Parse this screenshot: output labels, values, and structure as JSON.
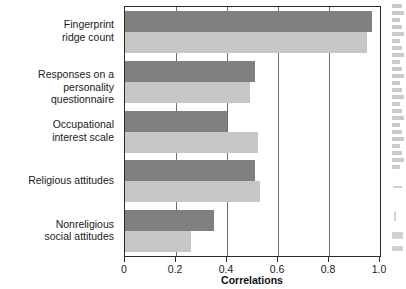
{
  "chart_data": {
    "type": "bar",
    "orientation": "horizontal",
    "title": "",
    "subtitle": "",
    "xlabel": "Correlations",
    "ylabel": "",
    "xlim": [
      0,
      1.0
    ],
    "xticks": [
      0,
      0.2,
      0.4,
      0.6,
      0.8,
      1.0
    ],
    "xticklabels": [
      "0",
      "0.2",
      "0.4",
      "0.6",
      "0.8",
      "1.0"
    ],
    "grid": "vertical",
    "legend": "none",
    "categories": [
      "Fingerprint\nridge count",
      "Responses on a\npersonality questionnaire",
      "Occupational\ninterest scale",
      "Religious attitudes",
      "Nonreligious\nsocial attitudes"
    ],
    "series": [
      {
        "name": "series-1",
        "color": "#808080",
        "values": [
          0.97,
          0.51,
          0.4,
          0.51,
          0.35
        ]
      },
      {
        "name": "series-2",
        "color": "#c6c6c6",
        "values": [
          0.95,
          0.49,
          0.52,
          0.53,
          0.26
        ]
      }
    ]
  },
  "figure": {
    "background": "#ffffff",
    "frame_color": "#2b2b2b",
    "gridline_color": "#6f6f6f",
    "text_color": "#1a1a1a"
  }
}
